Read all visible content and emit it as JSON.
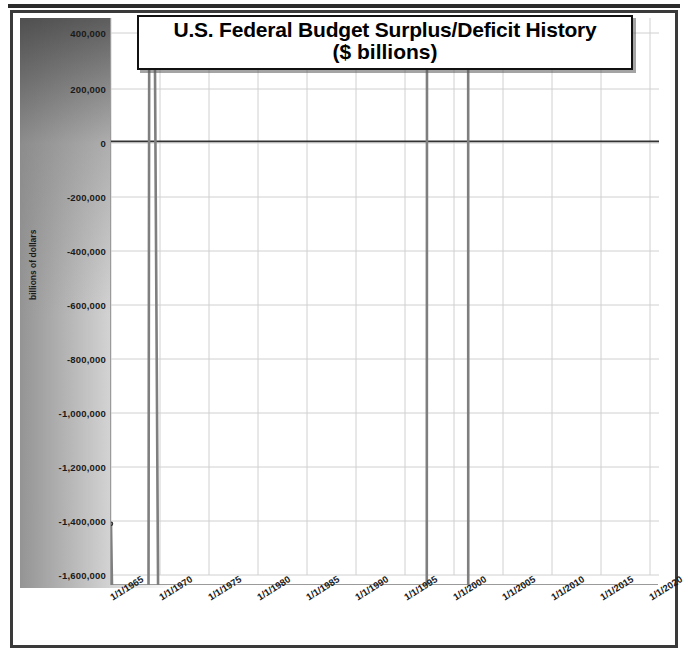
{
  "chart_data": {
    "type": "line",
    "title": "U.S. Federal Budget Surplus/Deficit History",
    "subtitle": "($ billions)",
    "xlabel": "",
    "ylabel": "billions of dollars",
    "ylim": [
      -1600000,
      400000
    ],
    "ytick_values": [
      400000,
      200000,
      0,
      -200000,
      -400000,
      -600000,
      -800000,
      -1000000,
      -1200000,
      -1400000,
      -1600000
    ],
    "ytick_labels": [
      "400,000",
      "200,000",
      "0",
      "-200,000",
      "-400,000",
      "-600,000",
      "-800,000",
      "-1,000,000",
      "-1,200,000",
      "-1,400,000",
      "-1,600,000"
    ],
    "xtick_labels": [
      "1/1/1965",
      "1/1/1970",
      "1/1/1975",
      "1/1/1980",
      "1/1/1985",
      "1/1/1990",
      "1/1/1995",
      "1/1/2000",
      "1/1/2005",
      "1/1/2010",
      "1/1/2015",
      "1/1/2020"
    ],
    "xlim_years": [
      1965,
      2020
    ],
    "grid": true,
    "legend": "none",
    "line_color": "#7f7f7f",
    "marker_color": "#2b2b2b",
    "zero_line_color": "#333333",
    "x": [
      1965,
      1966,
      1967,
      1968,
      1969,
      1970,
      1971,
      1972,
      1973,
      1974,
      1975,
      1976,
      1977,
      1978,
      1979,
      1980,
      1981,
      1982,
      1983,
      1984,
      1985,
      1986,
      1987,
      1988,
      1989,
      1990,
      1991,
      1992,
      1993,
      1994,
      1995,
      1996,
      1997,
      1998,
      1999,
      2000,
      2001,
      2002,
      2003,
      2004,
      2005,
      2006,
      2007,
      2008,
      2009,
      2010
    ],
    "values": [
      -1411,
      -3698,
      -8643,
      -25161,
      3242,
      -2842,
      -23033,
      -23373,
      -14908,
      -6135,
      -53242,
      -73732,
      -53659,
      -59186,
      -40726,
      -73835,
      -78976,
      -127989,
      -207802,
      -185367,
      -212308,
      -221227,
      -149730,
      -155178,
      -152639,
      -221036,
      -269238,
      -290321,
      -255051,
      -203186,
      -163952,
      -107431,
      -21884,
      69270,
      125610,
      236241,
      128236,
      -157758,
      -377585,
      -412727,
      -318346,
      -248181,
      -160701,
      -458553,
      -1412688,
      -1294204
    ],
    "note": "Values shown on axis are in thousands of dollars (labels up to -1,600,000); plotted series approximates annual US federal surplus/deficit."
  },
  "yticks_px": [
    {
      "label": "400,000",
      "top": 15
    },
    {
      "label": "200,000",
      "top": 71
    },
    {
      "label": "0",
      "top": 125
    },
    {
      "label": "-200,000",
      "top": 179
    },
    {
      "label": "-400,000",
      "top": 233
    },
    {
      "label": "-600,000",
      "top": 287
    },
    {
      "label": "-800,000",
      "top": 341
    },
    {
      "label": "-1,000,000",
      "top": 395
    },
    {
      "label": "-1,200,000",
      "top": 449
    },
    {
      "label": "-1,400,000",
      "top": 503
    },
    {
      "label": "-1,600,000",
      "top": 557
    }
  ],
  "xticks_px": [
    {
      "label": "1/1/1965",
      "left": 108
    },
    {
      "label": "1/1/1970",
      "left": 157
    },
    {
      "label": "1/1/1975",
      "left": 206
    },
    {
      "label": "1/1/1980",
      "left": 255
    },
    {
      "label": "1/1/1985",
      "left": 304
    },
    {
      "label": "1/1/1990",
      "left": 353
    },
    {
      "label": "1/1/1995",
      "left": 402
    },
    {
      "label": "1/1/2000",
      "left": 451
    },
    {
      "label": "1/1/2005",
      "left": 500
    },
    {
      "label": "1/1/2010",
      "left": 549
    },
    {
      "label": "1/1/2015",
      "left": 598
    },
    {
      "label": "1/1/2020",
      "left": 647
    }
  ]
}
